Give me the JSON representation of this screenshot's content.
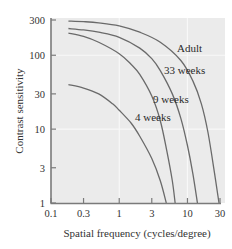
{
  "chart_data": {
    "type": "line",
    "title": "",
    "xlabel": "Spatial frequency (cycles/degree)",
    "ylabel": "Contrast sensitivity",
    "xscale": "log",
    "yscale": "log",
    "xlim": [
      0.1,
      30
    ],
    "ylim": [
      1,
      300
    ],
    "grid": true,
    "legend": "inline labels",
    "x_ticks": [
      0.1,
      0.3,
      1,
      3,
      10,
      30
    ],
    "x_tick_labels": [
      "0.1",
      "0.3",
      "1",
      "3",
      "10",
      "30"
    ],
    "y_ticks": [
      1,
      3,
      10,
      30,
      100,
      300
    ],
    "y_tick_labels": [
      "1",
      "3",
      "10",
      "30",
      "100",
      "300"
    ],
    "series": [
      {
        "name": "Adult",
        "x": [
          0.18,
          0.3,
          0.5,
          1,
          2,
          4,
          8,
          12,
          16,
          20,
          25,
          29
        ],
        "y": [
          290,
          285,
          275,
          250,
          205,
          150,
          85,
          45,
          22,
          9,
          2.5,
          1
        ]
      },
      {
        "name": "33 weeks",
        "x": [
          0.18,
          0.3,
          0.5,
          1,
          2,
          3,
          4,
          6,
          8,
          10,
          12,
          14
        ],
        "y": [
          230,
          220,
          205,
          175,
          125,
          90,
          62,
          30,
          14,
          6,
          2.5,
          1
        ]
      },
      {
        "name": "9 weeks",
        "x": [
          0.18,
          0.3,
          0.5,
          1,
          1.5,
          2,
          3,
          4,
          5,
          6,
          6.6
        ],
        "y": [
          200,
          180,
          150,
          105,
          75,
          55,
          28,
          13,
          5,
          2,
          1
        ]
      },
      {
        "name": "4 weeks",
        "x": [
          0.18,
          0.3,
          0.5,
          0.8,
          1,
          1.5,
          2,
          3,
          4,
          4.9
        ],
        "y": [
          40,
          36,
          30,
          22,
          18,
          12,
          8,
          4,
          2,
          1
        ]
      }
    ]
  },
  "labels": {
    "adult": "Adult",
    "w33": "33 weeks",
    "w9": "9 weeks",
    "w4": "4 weeks"
  },
  "colors": {
    "plot_background": "#ebebeb",
    "gridline": "#f8f8f8",
    "curve": "#6a6a6a",
    "axis": "#7a7a7a"
  }
}
